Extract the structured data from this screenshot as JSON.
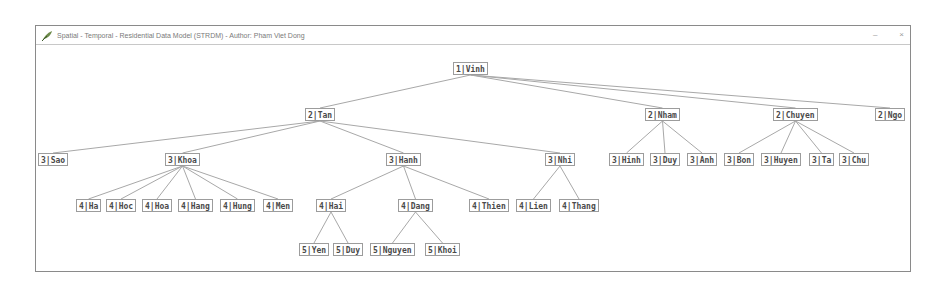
{
  "window": {
    "title": "Spatial - Temporal - Residential Data Model (STRDM) - Author: Pham Viet Dong",
    "icon": "feather-icon",
    "controls": {
      "minimize": "–",
      "close": "×"
    }
  },
  "tree": {
    "nodes": [
      {
        "id": "vinh",
        "label": "1|Vinh",
        "level": 1,
        "x": 453,
        "y": 62,
        "parent": null
      },
      {
        "id": "tan",
        "label": "2|Tan",
        "level": 2,
        "x": 305,
        "y": 108,
        "parent": "vinh"
      },
      {
        "id": "nham",
        "label": "2|Nham",
        "level": 2,
        "x": 645,
        "y": 108,
        "parent": "vinh"
      },
      {
        "id": "chuyen",
        "label": "2|Chuyen",
        "level": 2,
        "x": 773,
        "y": 108,
        "parent": "vinh"
      },
      {
        "id": "ngo",
        "label": "2|Ngo",
        "level": 2,
        "x": 875,
        "y": 108,
        "parent": "vinh"
      },
      {
        "id": "sao",
        "label": "3|Sao",
        "level": 3,
        "x": 38,
        "y": 153,
        "parent": "tan"
      },
      {
        "id": "khoa",
        "label": "3|Khoa",
        "level": 3,
        "x": 165,
        "y": 153,
        "parent": "tan"
      },
      {
        "id": "hanh",
        "label": "3|Hanh",
        "level": 3,
        "x": 386,
        "y": 153,
        "parent": "tan"
      },
      {
        "id": "nhi",
        "label": "3|Nhi",
        "level": 3,
        "x": 545,
        "y": 153,
        "parent": "tan"
      },
      {
        "id": "hinh",
        "label": "3|Hinh",
        "level": 3,
        "x": 609,
        "y": 153,
        "parent": "nham"
      },
      {
        "id": "duy3",
        "label": "3|Duy",
        "level": 3,
        "x": 650,
        "y": 153,
        "parent": "nham"
      },
      {
        "id": "anh",
        "label": "3|Anh",
        "level": 3,
        "x": 687,
        "y": 153,
        "parent": "nham"
      },
      {
        "id": "bon",
        "label": "3|Bon",
        "level": 3,
        "x": 724,
        "y": 153,
        "parent": "chuyen"
      },
      {
        "id": "huyen",
        "label": "3|Huyen",
        "level": 3,
        "x": 761,
        "y": 153,
        "parent": "chuyen"
      },
      {
        "id": "ta",
        "label": "3|Ta",
        "level": 3,
        "x": 809,
        "y": 153,
        "parent": "chuyen"
      },
      {
        "id": "chu",
        "label": "3|Chu",
        "level": 3,
        "x": 839,
        "y": 153,
        "parent": "chuyen"
      },
      {
        "id": "ha",
        "label": "4|Ha",
        "level": 4,
        "x": 76,
        "y": 199,
        "parent": "khoa"
      },
      {
        "id": "hoc",
        "label": "4|Hoc",
        "level": 4,
        "x": 106,
        "y": 199,
        "parent": "khoa"
      },
      {
        "id": "hoa",
        "label": "4|Hoa",
        "level": 4,
        "x": 142,
        "y": 199,
        "parent": "khoa"
      },
      {
        "id": "hang",
        "label": "4|Hang",
        "level": 4,
        "x": 178,
        "y": 199,
        "parent": "khoa"
      },
      {
        "id": "hung",
        "label": "4|Hung",
        "level": 4,
        "x": 220,
        "y": 199,
        "parent": "khoa"
      },
      {
        "id": "men",
        "label": "4|Men",
        "level": 4,
        "x": 263,
        "y": 199,
        "parent": "khoa"
      },
      {
        "id": "hai",
        "label": "4|Hai",
        "level": 4,
        "x": 316,
        "y": 199,
        "parent": "hanh"
      },
      {
        "id": "dang",
        "label": "4|Dang",
        "level": 4,
        "x": 398,
        "y": 199,
        "parent": "hanh"
      },
      {
        "id": "thien",
        "label": "4|Thien",
        "level": 4,
        "x": 469,
        "y": 199,
        "parent": "hanh"
      },
      {
        "id": "lien",
        "label": "4|Lien",
        "level": 4,
        "x": 516,
        "y": 199,
        "parent": "nhi"
      },
      {
        "id": "thang",
        "label": "4|Thang",
        "level": 4,
        "x": 559,
        "y": 199,
        "parent": "nhi"
      },
      {
        "id": "yen",
        "label": "5|Yen",
        "level": 5,
        "x": 299,
        "y": 243,
        "parent": "hai"
      },
      {
        "id": "duy5",
        "label": "5|Duy",
        "level": 5,
        "x": 333,
        "y": 243,
        "parent": "hai"
      },
      {
        "id": "nguyen",
        "label": "5|Nguyen",
        "level": 5,
        "x": 370,
        "y": 243,
        "parent": "dang"
      },
      {
        "id": "khoi",
        "label": "5|Khoi",
        "level": 5,
        "x": 425,
        "y": 243,
        "parent": "dang"
      }
    ]
  },
  "colors": {
    "line": "#a8a8a8",
    "node_border": "#9c9c9c",
    "text": "#4a4a4a"
  }
}
